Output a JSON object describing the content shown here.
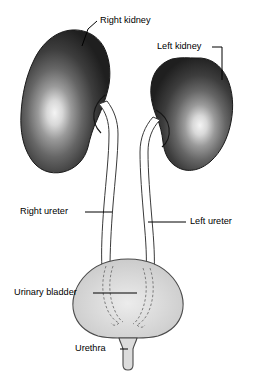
{
  "diagram": {
    "background_color": "#ffffff",
    "labels": [
      {
        "id": "right-kidney",
        "text": "Right kidney",
        "text_x": 100,
        "text_y": 21,
        "anchor": "start"
      },
      {
        "id": "left-kidney",
        "text": "Left kidney",
        "text_x": 157,
        "text_y": 47,
        "anchor": "start"
      },
      {
        "id": "right-ureter",
        "text": "Right ureter",
        "text_x": 20,
        "text_y": 212,
        "anchor": "start"
      },
      {
        "id": "left-ureter",
        "text": "Left ureter",
        "text_x": 190,
        "text_y": 222,
        "anchor": "start"
      },
      {
        "id": "urinary-bladder",
        "text": "Urinary bladder",
        "text_x": 14,
        "text_y": 293,
        "anchor": "start"
      },
      {
        "id": "urethra",
        "text": "Urethra",
        "text_x": 75,
        "text_y": 349,
        "anchor": "start"
      }
    ],
    "organs": {
      "right_kidney_name": "Right kidney",
      "left_kidney_name": "Left kidney",
      "right_ureter_name": "Right ureter",
      "left_ureter_name": "Left ureter",
      "bladder_name": "Urinary bladder",
      "urethra_name": "Urethra"
    },
    "colors": {
      "kidney_dark": "#242424",
      "kidney_mid": "#4d4d4d",
      "kidney_highlight": "#f2f2f2",
      "bladder_fill": "#d2d2d2",
      "bladder_highlight": "#ebebeb",
      "outline": "#1a1a1a",
      "tube_fill": "#ffffff",
      "tube_stroke": "#3a3a3a",
      "dashed_stroke": "#7d7d7d",
      "label_text": "#000000",
      "background": "#ffffff"
    }
  }
}
